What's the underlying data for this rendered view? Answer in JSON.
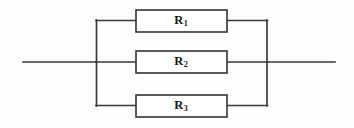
{
  "diagram": {
    "type": "electrical-schematic",
    "background_color": "#fdfdfd",
    "wire_color": "#3a3a3a",
    "box_fill_color": "#ffffff",
    "box_stroke_color": "#333333",
    "label_color": "#151515",
    "resistors": [
      {
        "id": "r1",
        "symbol": "R",
        "subscript": "1",
        "position": "top"
      },
      {
        "id": "r2",
        "symbol": "R",
        "subscript": "2",
        "position": "middle"
      },
      {
        "id": "r3",
        "symbol": "R",
        "subscript": "3",
        "position": "bottom"
      }
    ],
    "terminals": [
      {
        "id": "left-terminal",
        "side": "left"
      },
      {
        "id": "right-terminal",
        "side": "right"
      }
    ]
  }
}
